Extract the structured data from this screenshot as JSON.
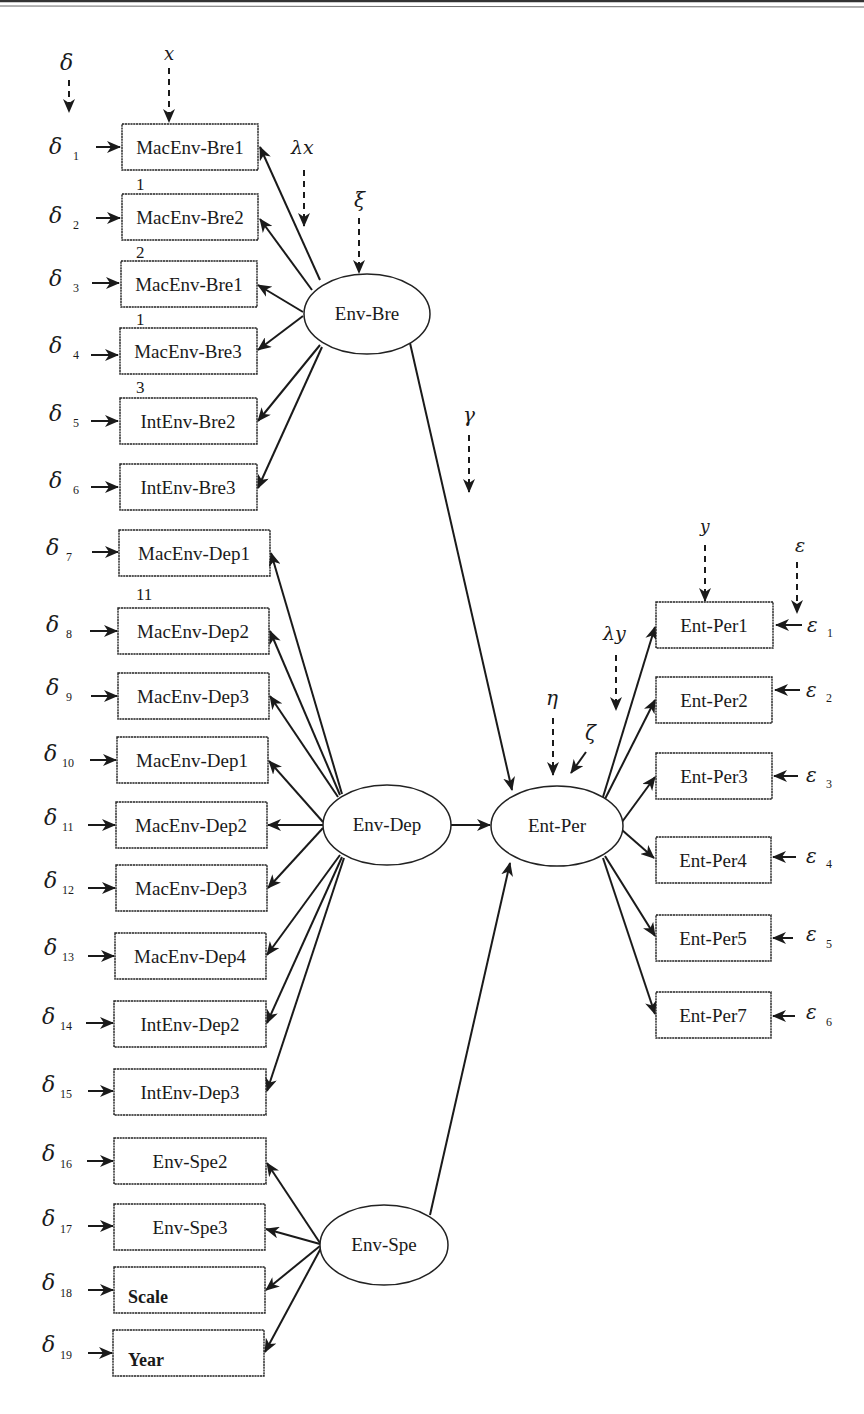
{
  "colors": {
    "stroke": "#1a1a1a",
    "background": "#ffffff"
  },
  "diagram": {
    "type": "structural-equation-model",
    "legend_symbols": {
      "delta": "δ",
      "x": "x",
      "lambda_x": "λx",
      "xi": "ξ",
      "gamma": "γ",
      "eta": "η",
      "zeta": "ζ",
      "y": "y",
      "lambda_y": "λy",
      "epsilon": "ε"
    },
    "latent": {
      "env_bre": "Env-Bre",
      "env_dep": "Env-Dep",
      "env_spe": "Env-Spe",
      "ent_per": "Ent-Per"
    },
    "left_indicators": [
      {
        "label": "MacEnv-Bre1",
        "error": "δ",
        "sub": "1"
      },
      {
        "label": "MacEnv-Bre2",
        "error": "δ",
        "sub": "2"
      },
      {
        "label": "MacEnv-Bre1",
        "error": "δ",
        "sub": "3"
      },
      {
        "label": "MacEnv-Bre3",
        "error": "δ",
        "sub": "4"
      },
      {
        "label": "IntEnv-Bre2",
        "error": "δ",
        "sub": "5"
      },
      {
        "label": "IntEnv-Bre3",
        "error": "δ",
        "sub": "6"
      },
      {
        "label": "MacEnv-Dep1",
        "error": "δ",
        "sub": "7"
      },
      {
        "label": "MacEnv-Dep2",
        "error": "δ",
        "sub": "8"
      },
      {
        "label": "MacEnv-Dep3",
        "error": "δ",
        "sub": "9"
      },
      {
        "label": "MacEnv-Dep1",
        "error": "δ",
        "sub": "10"
      },
      {
        "label": "MacEnv-Dep2",
        "error": "δ",
        "sub": "11"
      },
      {
        "label": "MacEnv-Dep3",
        "error": "δ",
        "sub": "12"
      },
      {
        "label": "MacEnv-Dep4",
        "error": "δ",
        "sub": "13"
      },
      {
        "label": "IntEnv-Dep2",
        "error": "δ",
        "sub": "14"
      },
      {
        "label": "IntEnv-Dep3",
        "error": "δ",
        "sub": "15"
      },
      {
        "label": "Env-Spe2",
        "error": "δ",
        "sub": "16"
      },
      {
        "label": "Env-Spe3",
        "error": "δ",
        "sub": "17"
      },
      {
        "label": "Scale",
        "error": "δ",
        "sub": "18"
      },
      {
        "label": "Year",
        "error": "δ",
        "sub": "19"
      }
    ],
    "stray_numbers": [
      "1",
      "2",
      "1",
      "3",
      "11"
    ],
    "right_indicators": [
      {
        "label": "Ent-Per1",
        "error": "ε",
        "sub": "1"
      },
      {
        "label": "Ent-Per2",
        "error": "ε",
        "sub": "2"
      },
      {
        "label": "Ent-Per3",
        "error": "ε",
        "sub": "3"
      },
      {
        "label": "Ent-Per4",
        "error": "ε",
        "sub": "4"
      },
      {
        "label": "Ent-Per5",
        "error": "ε",
        "sub": "5"
      },
      {
        "label": "Ent-Per7",
        "error": "ε",
        "sub": "6"
      }
    ]
  }
}
